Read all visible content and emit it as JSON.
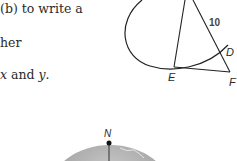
{
  "text": {
    "line1": "(b) to write a",
    "line2": "her",
    "line3_var1": "x",
    "line3_mid": " and ",
    "line3_var2": "y",
    "line3_end": "."
  },
  "figure": {
    "segment_label": "10",
    "point_d": "D",
    "point_e": "E",
    "point_f": "F"
  },
  "globe": {
    "north_label": "N"
  }
}
